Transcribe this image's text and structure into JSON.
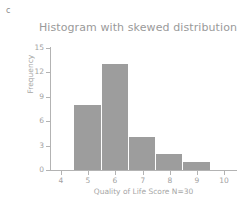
{
  "panel": {
    "label": "c"
  },
  "chart_data": {
    "type": "bar",
    "title": "Histogram with skewed distribution",
    "xlabel": "Quality of Life Score N=30",
    "ylabel": "Frequency",
    "categories": [
      5,
      6,
      7,
      8,
      9
    ],
    "values": [
      8,
      13,
      4,
      2,
      1
    ],
    "bin_width": 1,
    "xlim": [
      3.6,
      10.4
    ],
    "ylim": [
      0,
      15
    ],
    "xticks": [
      4,
      5,
      6,
      7,
      8,
      9,
      10
    ],
    "yticks": [
      0,
      3,
      6,
      9,
      12,
      15
    ],
    "xtick_labels": [
      "4",
      "5",
      "6",
      "7",
      "8",
      "9",
      "10"
    ],
    "ytick_labels": [
      "0",
      "3",
      "6",
      "9",
      "12",
      "15"
    ],
    "grid": false,
    "legend": "none",
    "bar_color": "#9d9d9d",
    "axis_color": "#b3b3b3",
    "text_color": "#a2a2a2",
    "title_color": "#9a9a9a"
  }
}
